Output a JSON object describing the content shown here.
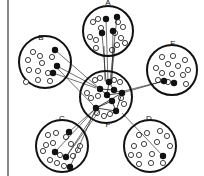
{
  "diagram": {
    "type": "network-cluster-diagram",
    "left_rule": {
      "x": 8,
      "y1": 0,
      "y2": 176
    },
    "colors": {
      "stroke": "#111111",
      "filled_node": "#111111",
      "open_node": "#ffffff",
      "background": "#ffffff"
    },
    "clusters": [
      {
        "id": "A",
        "label": "A",
        "cx": 108,
        "cy": 31,
        "r": 25,
        "label_x": 108,
        "label_y": 5,
        "open_nodes": [
          [
            93,
            22
          ],
          [
            98,
            19
          ],
          [
            101,
            28
          ],
          [
            118,
            22
          ],
          [
            123,
            27
          ],
          [
            115,
            33
          ],
          [
            90,
            37
          ],
          [
            96,
            40
          ],
          [
            121,
            38
          ],
          [
            96,
            48
          ],
          [
            117,
            45
          ],
          [
            112,
            50
          ],
          [
            125,
            43
          ]
        ],
        "filled_nodes": [
          [
            106,
            19
          ],
          [
            117,
            17
          ],
          [
            102,
            33
          ],
          [
            113,
            31
          ]
        ]
      },
      {
        "id": "B",
        "label": "B",
        "cx": 45,
        "cy": 62,
        "r": 26,
        "label_x": 41,
        "label_y": 40,
        "open_nodes": [
          [
            33,
            52
          ],
          [
            40,
            56
          ],
          [
            28,
            60
          ],
          [
            42,
            63
          ],
          [
            52,
            57
          ],
          [
            29,
            70
          ],
          [
            38,
            71
          ],
          [
            48,
            73
          ],
          [
            26,
            82
          ],
          [
            38,
            80
          ],
          [
            50,
            81
          ]
        ],
        "filled_nodes": [
          [
            55,
            50
          ],
          [
            57,
            66
          ],
          [
            53,
            73
          ]
        ]
      },
      {
        "id": "E",
        "label": "E",
        "cx": 172,
        "cy": 70,
        "r": 25,
        "label_x": 173,
        "label_y": 46,
        "open_nodes": [
          [
            162,
            57
          ],
          [
            173,
            56
          ],
          [
            185,
            60
          ],
          [
            156,
            68
          ],
          [
            168,
            64
          ],
          [
            178,
            66
          ],
          [
            188,
            70
          ],
          [
            162,
            73
          ],
          [
            172,
            74
          ],
          [
            183,
            75
          ],
          [
            158,
            80
          ],
          [
            168,
            82
          ],
          [
            186,
            84
          ]
        ],
        "filled_nodes": [
          [
            164,
            81
          ],
          [
            174,
            83
          ]
        ]
      },
      {
        "id": "F",
        "label": "F",
        "cx": 106,
        "cy": 97,
        "r": 26,
        "label_x": 108,
        "label_y": 127,
        "open_nodes": [
          [
            95,
            80
          ],
          [
            100,
            78
          ],
          [
            114,
            80
          ],
          [
            120,
            82
          ],
          [
            87,
            93
          ],
          [
            91,
            98
          ],
          [
            98,
            96
          ],
          [
            121,
            98
          ],
          [
            124,
            104
          ],
          [
            97,
            113
          ],
          [
            104,
            116
          ],
          [
            110,
            114
          ]
        ],
        "filled_nodes": [
          [
            109,
            82
          ],
          [
            100,
            89
          ],
          [
            107,
            95
          ],
          [
            122,
            93
          ],
          [
            112,
            101
          ],
          [
            96,
            108
          ],
          [
            116,
            111
          ],
          [
            114,
            90
          ]
        ],
        "internal_edges": [
          [
            [
              109,
              82
            ],
            [
              107,
              95
            ]
          ],
          [
            [
              100,
              89
            ],
            [
              107,
              95
            ]
          ],
          [
            [
              107,
              95
            ],
            [
              122,
              93
            ]
          ],
          [
            [
              107,
              95
            ],
            [
              112,
              101
            ]
          ],
          [
            [
              112,
              101
            ],
            [
              96,
              108
            ]
          ],
          [
            [
              112,
              101
            ],
            [
              116,
              111
            ]
          ],
          [
            [
              96,
              108
            ],
            [
              116,
              111
            ]
          ],
          [
            [
              122,
              93
            ],
            [
              116,
              111
            ]
          ],
          [
            [
              100,
              89
            ],
            [
              114,
              90
            ]
          ],
          [
            [
              114,
              90
            ],
            [
              122,
              93
            ]
          ],
          [
            [
              109,
              82
            ],
            [
              114,
              90
            ]
          ],
          [
            [
              96,
              108
            ],
            [
              122,
              93
            ]
          ]
        ]
      },
      {
        "id": "C",
        "label": "C",
        "cx": 62,
        "cy": 146,
        "r": 26,
        "label_x": 62,
        "label_y": 121,
        "open_nodes": [
          [
            48,
            135
          ],
          [
            56,
            133
          ],
          [
            66,
            137
          ],
          [
            46,
            145
          ],
          [
            53,
            143
          ],
          [
            71,
            144
          ],
          [
            78,
            150
          ],
          [
            43,
            151
          ],
          [
            60,
            155
          ],
          [
            73,
            156
          ],
          [
            50,
            160
          ],
          [
            57,
            163
          ],
          [
            64,
            166
          ],
          [
            80,
            146
          ]
        ],
        "filled_nodes": [
          [
            69,
            132
          ],
          [
            55,
            152
          ],
          [
            66,
            157
          ],
          [
            70,
            167
          ]
        ]
      },
      {
        "id": "D",
        "label": "D",
        "cx": 150,
        "cy": 146,
        "r": 26,
        "label_x": 149,
        "label_y": 121,
        "open_nodes": [
          [
            139,
            135
          ],
          [
            147,
            133
          ],
          [
            160,
            131
          ],
          [
            167,
            136
          ],
          [
            134,
            146
          ],
          [
            144,
            144
          ],
          [
            157,
            142
          ],
          [
            170,
            146
          ],
          [
            131,
            155
          ],
          [
            139,
            155
          ],
          [
            152,
            154
          ],
          [
            139,
            164
          ],
          [
            151,
            163
          ],
          [
            163,
            163
          ]
        ],
        "filled_nodes": [
          [
            163,
            156
          ]
        ]
      }
    ],
    "inter_cluster_edges": [
      {
        "from": "A",
        "to": "F",
        "lines": [
          [
            [
              106,
              19
            ],
            [
              108,
              82
            ]
          ],
          [
            [
              117,
              17
            ],
            [
              110,
              82
            ]
          ],
          [
            [
              102,
              33
            ],
            [
              106,
              82
            ]
          ],
          [
            [
              113,
              31
            ],
            [
              112,
              82
            ]
          ],
          [
            [
              104,
              46
            ],
            [
              105,
              81
            ]
          ],
          [
            [
              115,
              46
            ],
            [
              111,
              81
            ]
          ]
        ]
      },
      {
        "from": "B",
        "to": "F",
        "lines": [
          [
            [
              55,
              50
            ],
            [
              100,
              89
            ]
          ],
          [
            [
              57,
              66
            ],
            [
              100,
              89
            ]
          ],
          [
            [
              53,
              73
            ],
            [
              96,
              88
            ]
          ],
          [
            [
              57,
              68
            ],
            [
              96,
              108
            ]
          ]
        ]
      },
      {
        "from": "E",
        "to": "F",
        "lines": [
          [
            [
              164,
              81
            ],
            [
              122,
              93
            ]
          ],
          [
            [
              164,
              81
            ],
            [
              124,
              91
            ]
          ]
        ]
      },
      {
        "from": "C",
        "to": "F",
        "lines": [
          [
            [
              69,
              132
            ],
            [
              96,
              108
            ]
          ],
          [
            [
              55,
              152
            ],
            [
              96,
              108
            ]
          ],
          [
            [
              66,
              157
            ],
            [
              98,
              108
            ]
          ],
          [
            [
              70,
              167
            ],
            [
              96,
              108
            ]
          ],
          [
            [
              66,
              157
            ],
            [
              100,
              110
            ]
          ]
        ]
      },
      {
        "from": "D",
        "to": "F",
        "lines": [
          [
            [
              163,
              156
            ],
            [
              122,
              113
            ]
          ]
        ]
      }
    ]
  }
}
